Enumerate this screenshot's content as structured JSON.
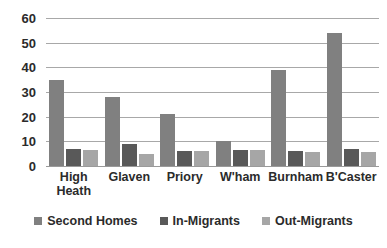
{
  "chart_data": {
    "type": "bar",
    "title": "",
    "subtitle": "",
    "xlabel": "",
    "ylabel": "",
    "ylim": [
      0,
      60
    ],
    "yticks": [
      60,
      50,
      40,
      30,
      20,
      10,
      0
    ],
    "grid": true,
    "legend_position": "bottom",
    "categories": [
      "High\nHeath",
      "Glaven",
      "Priory",
      "W'ham",
      "Burnham",
      "B'Caster"
    ],
    "series": [
      {
        "name": "Second Homes",
        "color": "#808080",
        "values": [
          35,
          28,
          21,
          10,
          39,
          54
        ]
      },
      {
        "name": "In-Migrants",
        "color": "#595959",
        "values": [
          7,
          9,
          6,
          6.5,
          6,
          7
        ]
      },
      {
        "name": "Out-Migrants",
        "color": "#a6a6a6",
        "values": [
          6.5,
          5,
          6,
          6.5,
          5.5,
          5.5
        ]
      }
    ]
  }
}
